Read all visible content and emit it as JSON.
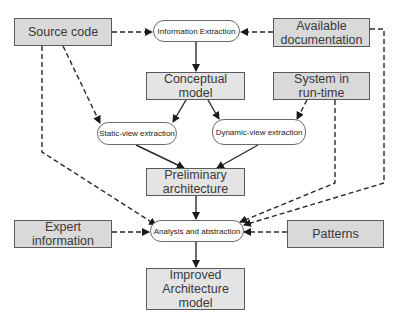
{
  "diagram": {
    "nodes": {
      "source_code": {
        "label": "Source code",
        "type": "input"
      },
      "info_extraction": {
        "label": "Information Extraction",
        "type": "process"
      },
      "available_doc": {
        "label_line1": "Available",
        "label_line2": "documentation",
        "type": "input"
      },
      "conceptual_model": {
        "label_line1": "Conceptual",
        "label_line2": "model",
        "type": "artifact"
      },
      "system_runtime": {
        "label_line1": "System in",
        "label_line2": "run-time",
        "type": "input"
      },
      "static_view": {
        "label": "Static-view extraction",
        "type": "process"
      },
      "dynamic_view": {
        "label": "Dynamic-view extraction",
        "type": "process"
      },
      "preliminary_arch": {
        "label_line1": "Preliminary",
        "label_line2": "architecture",
        "type": "artifact"
      },
      "analysis_abstraction": {
        "label": "Analysis and abstraction",
        "type": "process"
      },
      "expert_info": {
        "label_line1": "Expert",
        "label_line2": "information",
        "type": "input"
      },
      "patterns": {
        "label": "Patterns",
        "type": "input"
      },
      "improved_arch": {
        "label_line1": "Improved",
        "label_line2": "Architecture",
        "label_line3": "model",
        "type": "artifact"
      }
    },
    "edges": [
      {
        "from": "Source code",
        "to": "Information Extraction",
        "style": "dashed"
      },
      {
        "from": "Available documentation",
        "to": "Information Extraction",
        "style": "dashed"
      },
      {
        "from": "Information Extraction",
        "to": "Conceptual model",
        "style": "solid"
      },
      {
        "from": "Conceptual model",
        "to": "Static-view extraction",
        "style": "solid"
      },
      {
        "from": "Conceptual model",
        "to": "Dynamic-view extraction",
        "style": "solid"
      },
      {
        "from": "Source code",
        "to": "Static-view extraction",
        "style": "dashed"
      },
      {
        "from": "System in run-time",
        "to": "Dynamic-view extraction",
        "style": "dashed"
      },
      {
        "from": "Static-view extraction",
        "to": "Preliminary architecture",
        "style": "solid"
      },
      {
        "from": "Dynamic-view extraction",
        "to": "Preliminary architecture",
        "style": "solid"
      },
      {
        "from": "Preliminary architecture",
        "to": "Analysis and abstraction",
        "style": "solid"
      },
      {
        "from": "Source code",
        "to": "Analysis and abstraction",
        "style": "dashed"
      },
      {
        "from": "System in run-time",
        "to": "Analysis and abstraction",
        "style": "dashed"
      },
      {
        "from": "Available documentation",
        "to": "Analysis and abstraction",
        "style": "dashed"
      },
      {
        "from": "Expert information",
        "to": "Analysis and abstraction",
        "style": "dashed"
      },
      {
        "from": "Patterns",
        "to": "Analysis and abstraction",
        "style": "dashed"
      },
      {
        "from": "Analysis and abstraction",
        "to": "Improved Architecture model",
        "style": "solid"
      }
    ]
  },
  "colors": {
    "box_fill": "#d9d9d9",
    "box_border": "#5a5a5a",
    "process_fill": "#ffffff",
    "line": "#2a2a2a"
  }
}
